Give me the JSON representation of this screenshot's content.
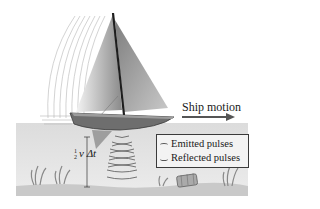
{
  "figure": {
    "labels": {
      "ship_motion": "Ship motion",
      "depth_formula_fraction_num": "1",
      "depth_formula_fraction_den": "2",
      "depth_formula_rest": "v Δt"
    },
    "legend": {
      "items": [
        {
          "label": "Emitted pulses"
        },
        {
          "label": "Reflected pulses"
        }
      ]
    },
    "colors": {
      "water": "#e4e4e4",
      "sea_floor": "#cfcfcf",
      "hull": "#6e6e6e",
      "sail": "#9a9a9a",
      "mast": "#1e1e1e",
      "pulse_lines": "#555555",
      "arrow": "#555555"
    }
  }
}
